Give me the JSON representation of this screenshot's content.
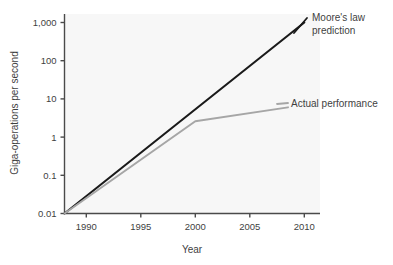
{
  "chart_data": {
    "type": "line",
    "title": "",
    "xlabel": "Year",
    "ylabel": "Giga-operations per second",
    "yscale": "log",
    "xlim": [
      1988,
      2012
    ],
    "ylim": [
      0.01,
      2000
    ],
    "grid": false,
    "legend_position": "inline-annotations",
    "xticks": [
      1990,
      1995,
      2000,
      2005,
      2010
    ],
    "xtick_labels": [
      "1990",
      "1995",
      "2000",
      "2005",
      "2010"
    ],
    "yticks": [
      0.01,
      0.1,
      1,
      10,
      100,
      1000
    ],
    "ytick_labels": [
      "0.01",
      "0.1",
      "1",
      "10",
      "100",
      "1,000"
    ],
    "series": [
      {
        "name": "Moore's law prediction",
        "color": "#1a1a1a",
        "x": [
          1988,
          2010
        ],
        "values": [
          0.01,
          1000
        ]
      },
      {
        "name": "Actual performance",
        "color": "#a6a6a6",
        "x": [
          1988,
          2000,
          2008.5
        ],
        "values": [
          0.01,
          2.6,
          6.0
        ]
      }
    ],
    "annotations": [
      {
        "name": "moores-law-prediction",
        "lines": [
          "Moore's law",
          "prediction"
        ],
        "color": "#1a1a1a"
      },
      {
        "name": "actual-performance",
        "lines": [
          "Actual performance"
        ],
        "color": "#a6a6a6"
      }
    ]
  },
  "colors": {
    "plot_background": "#f7f7f7",
    "axis": "#4a4a4a",
    "text": "#3f3f3f",
    "prediction_line": "#1a1a1a",
    "actual_line": "#a6a6a6"
  }
}
